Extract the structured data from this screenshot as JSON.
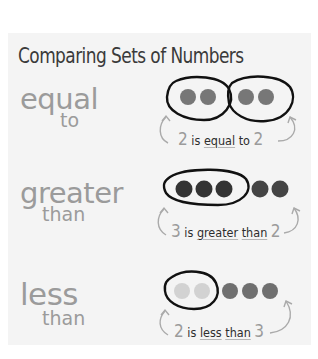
{
  "title": "Comparing Sets of Numbers",
  "rows": [
    {
      "main_word": "equal",
      "sub_word": "to",
      "left_count": 2,
      "right_count": 2,
      "caption": {
        "left_num": "2",
        "w1": "is",
        "w2": "equal",
        "w3": "to",
        "right_num": "2"
      }
    },
    {
      "main_word": "greater",
      "sub_word": "than",
      "left_count": 3,
      "right_count": 2,
      "caption": {
        "left_num": "3",
        "w1": "is",
        "w2": "greater",
        "w3": "than",
        "right_num": "2"
      }
    },
    {
      "main_word": "less",
      "sub_word": "than",
      "left_count": 2,
      "right_count": 3,
      "caption": {
        "left_num": "2",
        "w1": "is",
        "w2": "less",
        "w3": "than",
        "right_num": "3"
      }
    }
  ],
  "colors": {
    "panel_bg": "#f4f4f4",
    "title_text": "#3a3a3a",
    "word_gray": "#9b9b9b",
    "dot_medium": "#777777",
    "dot_dark": "#333333",
    "dot_light": "#d2d2d2",
    "outline": "#111111"
  }
}
